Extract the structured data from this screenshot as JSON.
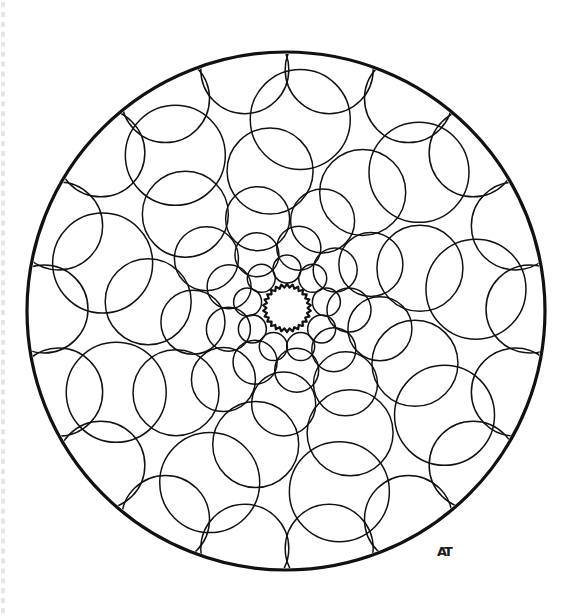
{
  "page": {
    "kind": "coloring-book-page",
    "width": 587,
    "height": 616,
    "background_color": "#ffffff",
    "ink_color": "#111111",
    "line_style": "black outline, no fill"
  },
  "binding": {
    "present": true,
    "side": "left",
    "label": "spiral binding edge artifact",
    "color": "#cfcfcf",
    "dash_count": 62
  },
  "signature": {
    "text": "AT",
    "label": "artist monogram",
    "x": 444,
    "y": 556,
    "color": "#1a1a1a"
  },
  "chart_data": {
    "type": "scatter",
    "xlabel": "",
    "ylabel": "",
    "grid": false,
    "legend": "none",
    "xlim": [
      0,
      587
    ],
    "ylim": [
      0,
      616
    ],
    "center": {
      "x": 287,
      "y": 309
    },
    "outer_boundary": {
      "name": "outer-rim-circle",
      "cx": 286,
      "cy": 311,
      "r": 259,
      "stroke_width": 3.2
    },
    "core": {
      "name": "scalloped-center",
      "cx": 287,
      "cy": 308,
      "r": 24,
      "scallop_count": 26,
      "scallop_depth": 3.4,
      "stroke_width": 2.2
    },
    "spiral": {
      "description": "logarithmic phyllotaxis spiral of tangent circles growing outward",
      "arms": 9,
      "rings": 6,
      "turn_degrees": 11,
      "growth_factor": 1.38,
      "ring_radii": [
        40,
        62,
        95,
        139,
        190,
        243
      ],
      "ring_circle_radii": [
        14,
        22,
        32,
        43,
        50,
        44
      ],
      "ring_counts": [
        9,
        9,
        9,
        9,
        9,
        18
      ],
      "stroke_width": 1.5
    },
    "series": [
      {
        "name": "ring-1",
        "count": 9,
        "orbit_radius": 40,
        "circle_radius": 14
      },
      {
        "name": "ring-2",
        "count": 9,
        "orbit_radius": 62,
        "circle_radius": 22
      },
      {
        "name": "ring-3",
        "count": 9,
        "orbit_radius": 95,
        "circle_radius": 32
      },
      {
        "name": "ring-4",
        "count": 9,
        "orbit_radius": 139,
        "circle_radius": 43
      },
      {
        "name": "ring-5",
        "count": 9,
        "orbit_radius": 190,
        "circle_radius": 50
      },
      {
        "name": "ring-6",
        "count": 18,
        "orbit_radius": 243,
        "circle_radius": 44
      }
    ]
  }
}
